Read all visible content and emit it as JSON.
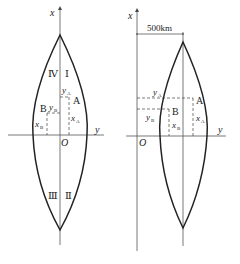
{
  "left_diagram": {
    "x_axis_label": "x",
    "y_axis_label": "y",
    "origin_label": "O",
    "quadrants": [
      "Ⅰ",
      "Ⅱ",
      "Ⅲ",
      "Ⅳ"
    ],
    "point_a": {
      "label": "A",
      "x_label": "x",
      "x_sub": "A",
      "y_label": "y",
      "y_sub": "A"
    },
    "point_b": {
      "label": "B",
      "x_label": "x",
      "x_sub": "B",
      "y_label": "y",
      "y_sub": "B"
    }
  },
  "right_diagram": {
    "x_axis_label": "x",
    "y_axis_label": "y",
    "origin_label": "O",
    "offset_label": "500km",
    "point_a": {
      "label": "A",
      "x_label": "x",
      "x_sub": "A",
      "y_label": "y",
      "y_sub": "A"
    },
    "point_b": {
      "label": "B",
      "x_label": "x",
      "x_sub": "B",
      "y_label": "y",
      "y_sub": "B"
    }
  }
}
